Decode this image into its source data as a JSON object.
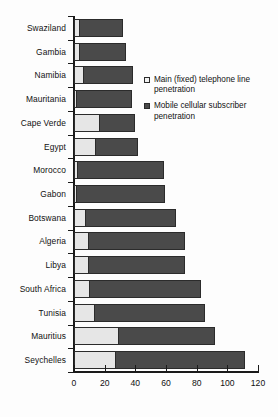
{
  "chart_data": {
    "type": "bar",
    "orientation": "horizontal",
    "stacked": true,
    "title": "",
    "xlabel": "",
    "ylabel": "",
    "xlim": [
      0,
      120
    ],
    "xticks": [
      0,
      20,
      40,
      60,
      80,
      100,
      120
    ],
    "grid": false,
    "legend_position": "upper-right-inside",
    "categories": [
      "Swaziland",
      "Gambia",
      "Namibia",
      "Mauritania",
      "Cape Verde",
      "Egypt",
      "Morocco",
      "Gabon",
      "Botswana",
      "Algeria",
      "Libya",
      "South Africa",
      "Tunisia",
      "Mauritius",
      "Seychelles"
    ],
    "series": [
      {
        "name": "Main (fixed) telephone line penetration",
        "color": "#e6e6e6",
        "values": [
          3,
          3,
          6,
          1,
          16,
          14,
          2,
          1,
          7,
          9,
          9,
          10,
          13,
          29,
          27
        ]
      },
      {
        "name": "Mobile cellular subscriber penetration",
        "color": "#4a4a4a",
        "values": [
          28,
          30,
          32,
          36,
          23,
          27,
          56,
          58,
          59,
          63,
          63,
          72,
          72,
          62,
          84
        ]
      }
    ],
    "totals": [
      31,
      33,
      38,
      37,
      39,
      41,
      58,
      59,
      66,
      72,
      72,
      82,
      85,
      91,
      111
    ]
  },
  "legend": {
    "entries": [
      {
        "label": "Main (fixed) telephone line penetration",
        "marker": "open-square-marker"
      },
      {
        "label": "Mobile cellular subscriber penetration",
        "marker": "filled-square-marker"
      }
    ]
  },
  "axis": {
    "x_tick_labels": [
      "0",
      "20",
      "40",
      "60",
      "80",
      "100",
      "120"
    ]
  }
}
